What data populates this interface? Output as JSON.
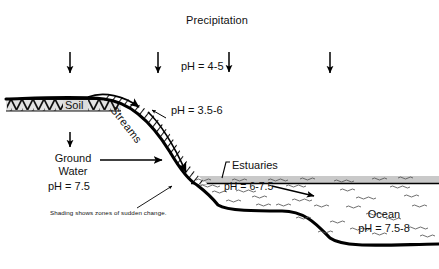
{
  "diagram": {
    "title": "Precipitation",
    "labels": {
      "precipitation_ph": "pH = 4-5",
      "soil": "Soil",
      "streams": "Streams",
      "streams_ph": "pH = 3.5-6",
      "ground_water_line1": "Ground",
      "ground_water_line2": "Water",
      "ground_water_ph": "pH = 7.5",
      "caption": "Shading shows zones of sudden change.",
      "estuaries": "Estuaries",
      "estuaries_ph": "pH = 6-7.5",
      "ocean": "Ocean",
      "ocean_ph": "pH = 7.5-8"
    },
    "colors": {
      "ink": "#111111",
      "water_band": "#c9c9c9",
      "soil_band": "#d8d8d8",
      "line": "#000000"
    },
    "ph_values": {
      "precipitation": "4-5",
      "streams": "3.5-6",
      "ground_water": "7.5",
      "estuaries": "6-7.5",
      "ocean": "7.5-8"
    },
    "arrows": {
      "precipitation_count": 4
    }
  }
}
